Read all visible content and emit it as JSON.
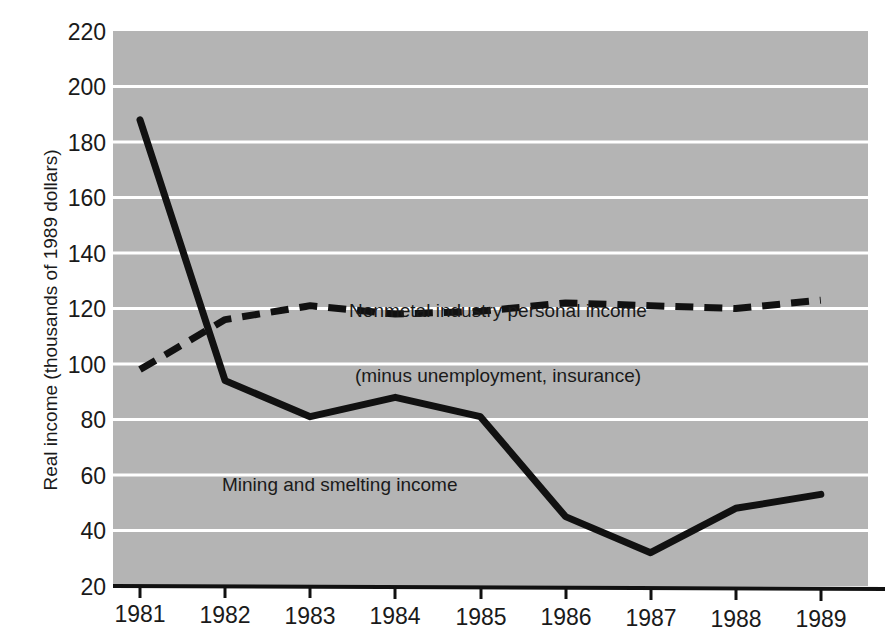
{
  "chart_data": {
    "type": "line",
    "title": "",
    "xlabel": "",
    "ylabel": "Real income (thousands of 1989 dollars)",
    "categories": [
      "1981",
      "1982",
      "1983",
      "1984",
      "1985",
      "1986",
      "1987",
      "1988",
      "1989"
    ],
    "x": [
      1981,
      1982,
      1983,
      1984,
      1985,
      1986,
      1987,
      1988,
      1989
    ],
    "xlim": [
      1980.7,
      1989.3
    ],
    "ylim": [
      20,
      220
    ],
    "yticks": [
      20,
      40,
      60,
      80,
      100,
      120,
      140,
      160,
      180,
      200,
      220
    ],
    "ytick_labels": [
      "20",
      "40",
      "60",
      "80",
      "100",
      "120",
      "140",
      "160",
      "180",
      "200",
      "220"
    ],
    "grid": "horizontal",
    "legend_position": "inline-annotations",
    "plot_background": "#b4b4b4",
    "gridline_color": "#ffffff",
    "series": [
      {
        "name": "Mining and smelting income",
        "style": "solid",
        "color": "#111111",
        "values": [
          188,
          94,
          81,
          88,
          81,
          45,
          32,
          48,
          53
        ]
      },
      {
        "name": "Nonmetal industry personal income (minus unemployment, insurance)",
        "style": "dashed",
        "color": "#111111",
        "values": [
          98,
          116,
          121,
          118,
          119,
          122,
          121,
          120,
          123
        ]
      }
    ],
    "annotations": [
      {
        "id": "nonmetal-label",
        "line1": "Nonmetal industry personal income",
        "line2": "(minus unemployment, insurance)"
      },
      {
        "id": "mining-label",
        "line1": "Mining and smelting income"
      }
    ]
  }
}
